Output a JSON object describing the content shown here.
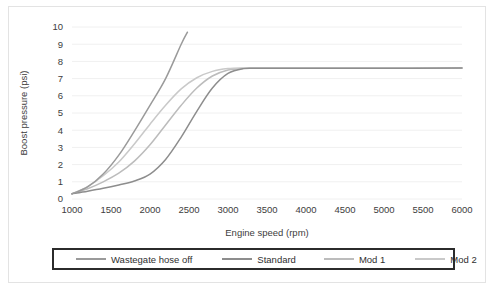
{
  "chart_data": {
    "type": "line",
    "title": "",
    "xlabel": "Engine speed (rpm)",
    "ylabel": "Boost pressure (psi)",
    "xlim": [
      1000,
      6000
    ],
    "ylim": [
      0,
      10
    ],
    "xticks": [
      "1000",
      "1500",
      "2000",
      "2500",
      "3000",
      "3500",
      "4000",
      "4500",
      "5000",
      "5500",
      "6000"
    ],
    "yticks": [
      "10",
      "9",
      "8",
      "7",
      "6",
      "5",
      "4",
      "3",
      "2",
      "1",
      "0"
    ],
    "grid": "horizontal",
    "legend_position": "bottom",
    "series": [
      {
        "name": "Wastegate hose off",
        "color": "#9a9a9a",
        "x": [
          1000,
          1200,
          1400,
          1600,
          1800,
          2000,
          2200,
          2400,
          2480
        ],
        "y": [
          0.3,
          0.7,
          1.45,
          2.55,
          3.95,
          5.45,
          7.0,
          9.0,
          9.7
        ]
      },
      {
        "name": "Standard",
        "color": "#8d8d8d",
        "x": [
          1000,
          1200,
          1400,
          1600,
          1800,
          2000,
          2200,
          2400,
          2600,
          2800,
          3000,
          3200,
          3400,
          4000,
          5000,
          6000
        ],
        "y": [
          0.3,
          0.45,
          0.62,
          0.82,
          1.05,
          1.45,
          2.3,
          3.6,
          5.1,
          6.45,
          7.3,
          7.58,
          7.6,
          7.6,
          7.6,
          7.62
        ]
      },
      {
        "name": "Mod 1",
        "color": "#bcbcbc",
        "x": [
          1000,
          1200,
          1400,
          1600,
          1800,
          2000,
          2200,
          2400,
          2600,
          2800,
          3000,
          3200,
          3400,
          4000,
          5000,
          6000
        ],
        "y": [
          0.3,
          0.6,
          1.0,
          1.5,
          2.2,
          3.15,
          4.3,
          5.45,
          6.45,
          7.15,
          7.5,
          7.6,
          7.6,
          7.6,
          7.6,
          7.62
        ]
      },
      {
        "name": "Mod 2",
        "color": "#c9c9c9",
        "x": [
          1000,
          1200,
          1400,
          1600,
          1800,
          2000,
          2200,
          2400,
          2600,
          2800,
          3000,
          3200,
          3400,
          4000,
          5000,
          6000
        ],
        "y": [
          0.3,
          0.72,
          1.35,
          2.15,
          3.2,
          4.35,
          5.45,
          6.4,
          7.05,
          7.42,
          7.58,
          7.62,
          7.62,
          7.62,
          7.62,
          7.62
        ]
      }
    ]
  }
}
